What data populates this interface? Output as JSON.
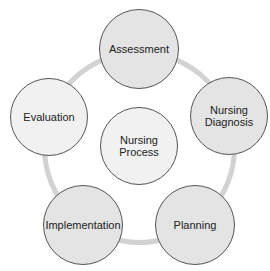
{
  "diagram": {
    "type": "cycle",
    "ring": {
      "color": "#d2d2d2",
      "cx": 139,
      "cy": 147,
      "r": 95,
      "thickness": 5
    },
    "center": {
      "label": "Nursing\nProcess",
      "cx": 139,
      "cy": 146,
      "r": 39,
      "fill": "#f1f1f1"
    },
    "nodes": [
      {
        "id": "assessment",
        "label": "Assessment",
        "cx": 139,
        "cy": 49,
        "r": 40,
        "fill": "#e4e4e4"
      },
      {
        "id": "nursing-diagnosis",
        "label": "Nursing\nDiagnosis",
        "cx": 229,
        "cy": 116,
        "r": 39,
        "fill": "#e4e4e4"
      },
      {
        "id": "planning",
        "label": "Planning",
        "cx": 195,
        "cy": 225,
        "r": 40,
        "fill": "#e4e4e4"
      },
      {
        "id": "implementation",
        "label": "Implementation",
        "cx": 83,
        "cy": 225,
        "r": 40,
        "fill": "#e4e4e4"
      },
      {
        "id": "evaluation",
        "label": "Evaluation",
        "cx": 49,
        "cy": 117,
        "r": 39,
        "fill": "#f1f1f1"
      }
    ]
  }
}
